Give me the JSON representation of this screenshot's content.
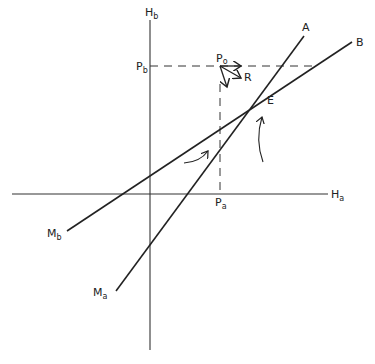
{
  "diagram": {
    "axes": {
      "x_label_main": "H",
      "x_label_sub": "a",
      "y_label_main": "H",
      "y_label_sub": "b"
    },
    "points": {
      "pb_main": "P",
      "pb_sub": "b",
      "pa_main": "P",
      "pa_sub": "a",
      "po_main": "P",
      "po_sub": "o",
      "r_label": "R",
      "e_label": "E"
    },
    "lines": {
      "a_label": "A",
      "b_label": "B",
      "ma_main": "M",
      "ma_sub": "a",
      "mb_main": "M",
      "mb_sub": "b"
    },
    "colors": {
      "ink": "#222222",
      "background": "#ffffff"
    }
  }
}
